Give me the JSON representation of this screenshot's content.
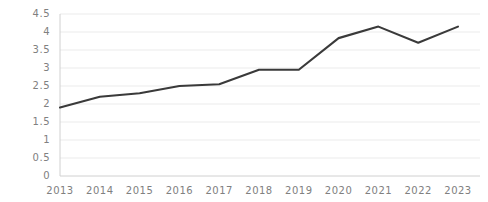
{
  "chart_data": {
    "type": "line",
    "title": "",
    "subtitle": "",
    "xlabel": "",
    "ylabel": "",
    "categories": [
      "2013",
      "2014",
      "2015",
      "2016",
      "2017",
      "2018",
      "2019",
      "2020",
      "2021",
      "2022",
      "2023"
    ],
    "x": [
      2013,
      2014,
      2015,
      2016,
      2017,
      2018,
      2019,
      2020,
      2021,
      2022,
      2023
    ],
    "values": [
      1.9,
      2.2,
      2.3,
      2.5,
      2.55,
      2.95,
      2.95,
      3.83,
      4.15,
      3.7,
      4.15
    ],
    "series": [
      {
        "name": "",
        "values": [
          1.9,
          2.2,
          2.3,
          2.5,
          2.55,
          2.95,
          2.95,
          3.83,
          4.15,
          3.7,
          4.15
        ],
        "color": "#3a3a3a"
      }
    ],
    "ylim": [
      0,
      4.5
    ],
    "y_ticks": [
      0,
      0.5,
      1,
      1.5,
      2,
      2.5,
      3,
      3.5,
      4,
      4.5
    ],
    "y_tick_labels": [
      "0",
      "0.5",
      "1",
      "1.5",
      "2",
      "2.5",
      "3",
      "3.5",
      "4",
      "4.5"
    ],
    "x_tick_labels": [
      "2013",
      "2014",
      "2015",
      "2016",
      "2017",
      "2018",
      "2019",
      "2020",
      "2021",
      "2022",
      "2023"
    ],
    "grid": true,
    "grid_axis": "y",
    "legend": false,
    "legend_position": "none",
    "annotations": [],
    "colors": {
      "line": "#3a3a3a",
      "grid": "#ebebeb",
      "axis": "#d0d0d0",
      "tick_label": "#808080",
      "background": "#ffffff"
    }
  },
  "layout": {
    "plot_left": 60,
    "plot_right": 458,
    "plot_top": 14,
    "plot_bottom": 176,
    "line_width": 2.1
  }
}
